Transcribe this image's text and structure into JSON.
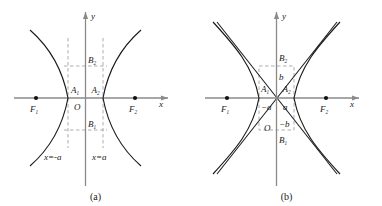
{
  "figure": {
    "background": "#ffffff",
    "ink": "#1a1a1a",
    "axis_color": "#8a8a8a",
    "dash_color": "#9a9a9a",
    "width": 382,
    "height": 206
  },
  "panels": [
    {
      "id": "a",
      "caption": "(a)",
      "axes": {
        "x_label": "x",
        "y_label": "y",
        "origin_label": "O"
      },
      "points": [
        {
          "name": "F1",
          "base": "F",
          "sub": "1",
          "role": "left-focus",
          "x": -58,
          "y": 0
        },
        {
          "name": "F2",
          "base": "F",
          "sub": "2",
          "role": "right-focus",
          "x": 58,
          "y": 0
        },
        {
          "name": "A1",
          "base": "A",
          "sub": "1",
          "role": "left-vertex",
          "x": -22,
          "y": 0
        },
        {
          "name": "A2",
          "base": "A",
          "sub": "2",
          "role": "right-vertex",
          "x": 22,
          "y": 0
        },
        {
          "name": "B2",
          "base": "B",
          "sub": "2",
          "role": "upper-conjugate",
          "x": 0,
          "y": 30
        },
        {
          "name": "B1",
          "base": "B",
          "sub": "1",
          "role": "lower-conjugate",
          "x": 0,
          "y": -30
        }
      ],
      "guide_lines": [
        {
          "name": "left-directrix-guide",
          "label": "x=-a",
          "label_parts": [
            "x",
            "=",
            "−",
            "a"
          ]
        },
        {
          "name": "right-directrix-guide",
          "label": "x=a",
          "label_parts": [
            "x",
            "=",
            "a"
          ]
        }
      ],
      "features": {
        "asymptotes_shown": false,
        "dashed_box_shown": true,
        "branches": 2
      }
    },
    {
      "id": "b",
      "caption": "(b)",
      "axes": {
        "x_label": "x",
        "y_label": "y",
        "origin_label": "O"
      },
      "points": [
        {
          "name": "F1",
          "base": "F",
          "sub": "1",
          "role": "left-focus",
          "x": -58,
          "y": 0
        },
        {
          "name": "F2",
          "base": "F",
          "sub": "2",
          "role": "right-focus",
          "x": 58,
          "y": 0
        },
        {
          "name": "A1",
          "base": "A",
          "sub": "1",
          "role": "left-vertex",
          "x": -22,
          "y": 0
        },
        {
          "name": "A2",
          "base": "A",
          "sub": "2",
          "role": "right-vertex",
          "x": 22,
          "y": 0
        },
        {
          "name": "B2",
          "base": "B",
          "sub": "2",
          "role": "upper-conjugate",
          "x": 0,
          "y": 30
        },
        {
          "name": "B1",
          "base": "B",
          "sub": "1",
          "role": "lower-conjugate",
          "x": 0,
          "y": -30
        }
      ],
      "measures": [
        {
          "name": "neg-a",
          "label": "−a",
          "position": "left-of-origin"
        },
        {
          "name": "pos-a",
          "label": "a",
          "position": "right-of-origin"
        },
        {
          "name": "pos-b",
          "label": "b",
          "position": "above-origin"
        },
        {
          "name": "neg-b",
          "label": "−b",
          "position": "below-origin"
        }
      ],
      "features": {
        "asymptotes_shown": true,
        "dashed_box_shown": true,
        "branches": 2
      }
    }
  ]
}
